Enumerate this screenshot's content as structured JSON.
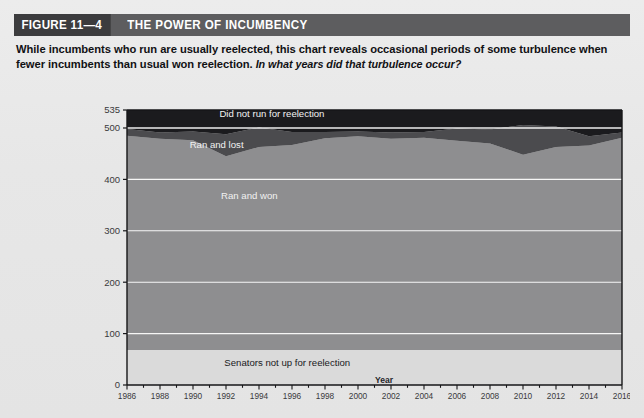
{
  "figure": {
    "number_label": "FIGURE 11—4",
    "title": "THE POWER OF INCUMBENCY",
    "caption_main": "While incumbents who run are usually reelected, this chart reveals occasional periods of some turbulence when fewer incumbents than usual won reelection.",
    "caption_question": "In what years did that turbulence occur?"
  },
  "colors": {
    "header_bar": "#5d5d5f",
    "header_number_box": "#3c3c3e",
    "page_background": "#e9e9e9",
    "band_not_up": "#dadada",
    "band_ran_and_won": "#8e8e90",
    "band_ran_and_lost": "#4b4b4e",
    "band_did_not_run": "#1b1b1e",
    "gridline": "#ffffff",
    "axis": "#1a1a1c"
  },
  "chart_data": {
    "type": "area",
    "stacked": true,
    "title": "THE POWER OF INCUMBENCY",
    "xlabel": "Year",
    "ylabel": "",
    "xlim": [
      1986,
      2016
    ],
    "ylim": [
      0,
      535
    ],
    "grid": true,
    "legend_position": "inline-band-labels",
    "ytick_values": [
      0,
      100,
      200,
      300,
      400,
      500,
      535
    ],
    "ytick_labels": [
      "0",
      "100",
      "200",
      "300",
      "400",
      "500",
      "535"
    ],
    "xtick_values": [
      1986,
      1988,
      1990,
      1992,
      1994,
      1996,
      1998,
      2000,
      2002,
      2004,
      2006,
      2008,
      2010,
      2012,
      2014,
      2016
    ],
    "xtick_labels": [
      "1986",
      "1988",
      "1990",
      "1992",
      "1994",
      "1996",
      "1998",
      "2000",
      "2002",
      "2004",
      "2006",
      "2008",
      "2010",
      "2012",
      "2014",
      "2016"
    ],
    "x": [
      1986,
      1988,
      1990,
      1992,
      1994,
      1996,
      1998,
      2000,
      2002,
      2004,
      2006,
      2008,
      2010,
      2012,
      2014,
      2016
    ],
    "series": [
      {
        "name": "Senators not up for reelection",
        "color": "#dadada",
        "label_color": "dark",
        "values": [
          68,
          68,
          68,
          68,
          68,
          68,
          68,
          68,
          68,
          68,
          68,
          68,
          68,
          68,
          68,
          68
        ]
      },
      {
        "name": "Ran and won",
        "color": "#8e8e90",
        "label_color": "light",
        "values": [
          417,
          411,
          408,
          377,
          395,
          399,
          412,
          416,
          411,
          413,
          407,
          402,
          380,
          395,
          398,
          413
        ]
      },
      {
        "name": "Ran and lost",
        "color": "#4b4b4e",
        "label_color": "light",
        "values": [
          13,
          12,
          17,
          43,
          38,
          25,
          12,
          9,
          12,
          11,
          24,
          27,
          58,
          40,
          18,
          10
        ]
      },
      {
        "name": "Did not run for reelection",
        "color": "#1b1b1e",
        "label_color": "light",
        "values": [
          37,
          44,
          42,
          47,
          34,
          43,
          43,
          42,
          44,
          43,
          36,
          38,
          29,
          32,
          51,
          44
        ]
      }
    ],
    "band_labels": [
      {
        "text": "Did not run for reelection",
        "x": 1991.6,
        "y": 522
      },
      {
        "text": "Ran and lost",
        "x": 1989.8,
        "y": 462
      },
      {
        "text": "Ran and won",
        "x": 1991.7,
        "y": 361
      },
      {
        "text": "Senators not up for reelection",
        "x": 1991.9,
        "y": 37
      }
    ]
  }
}
